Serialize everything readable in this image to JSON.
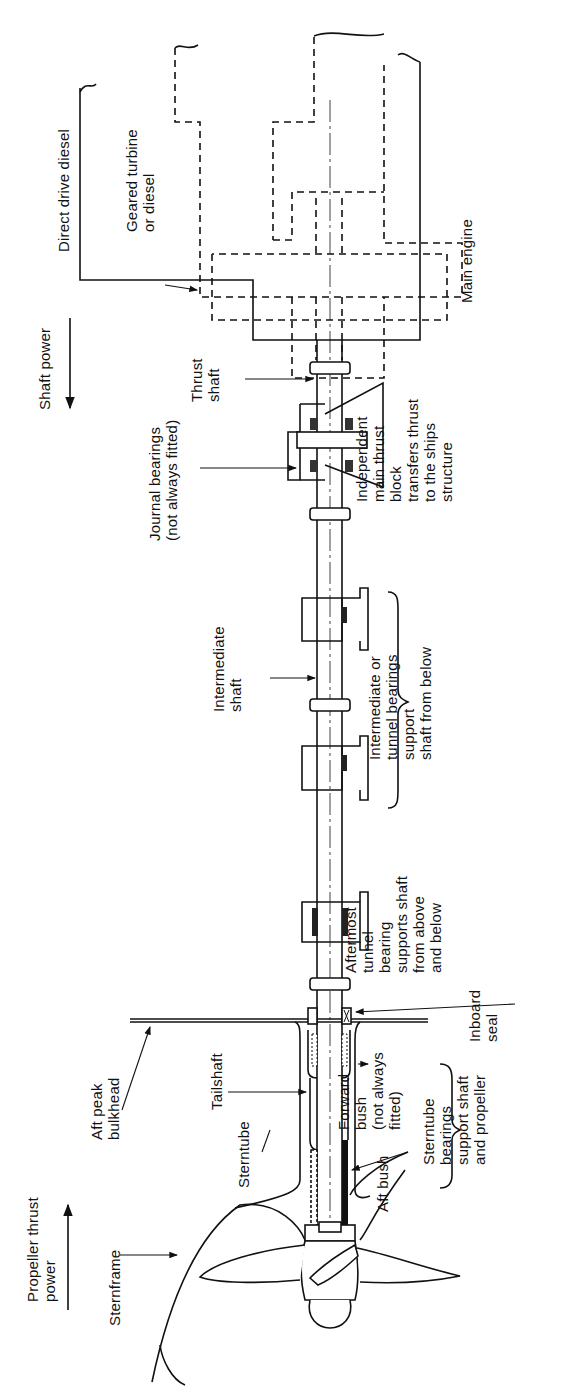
{
  "diagram": {
    "orientation": "rotated 90 degrees counter-clockwise",
    "line_color": "#111111",
    "background": "#ffffff"
  },
  "labels": {
    "direct_drive_diesel": "Direct drive diesel",
    "geared_turbine": "Geared turbine\nor diesel",
    "main_engine": "Main engine",
    "shaft_power": "Shaft power",
    "thrust_shaft": "Thrust\nshaft",
    "journal_bearings": "Journal bearings\n(not always fitted)",
    "thrust_block": "Independent\nmain thrust\nblock\ntransfers thrust\nto the ships\nstructure",
    "intermediate_shaft": "Intermediate\nshaft",
    "tunnel_bearings": "Intermediate or\ntunnel bearings\nsupport\nshaft from below",
    "aftermost_bearing": "Aftermost\ntunnel\nbearing\nsupports shaft\nfrom above\nand below",
    "inboard_seal": "Inboard\nseal",
    "aft_peak_bulkhead": "Aft peak\nbulkhead",
    "tailshaft": "Tailshaft",
    "sterntube": "Sterntube",
    "forward_bush": "Forward\nbush\n(not always\nfitted)",
    "aft_bush": "Aft bush",
    "sterntube_bearings": "Sterntube\nbearings\nsupport shaft\nand propeller",
    "propeller_thrust": "Propeller thrust\npower",
    "sternframe": "Sternframe"
  }
}
